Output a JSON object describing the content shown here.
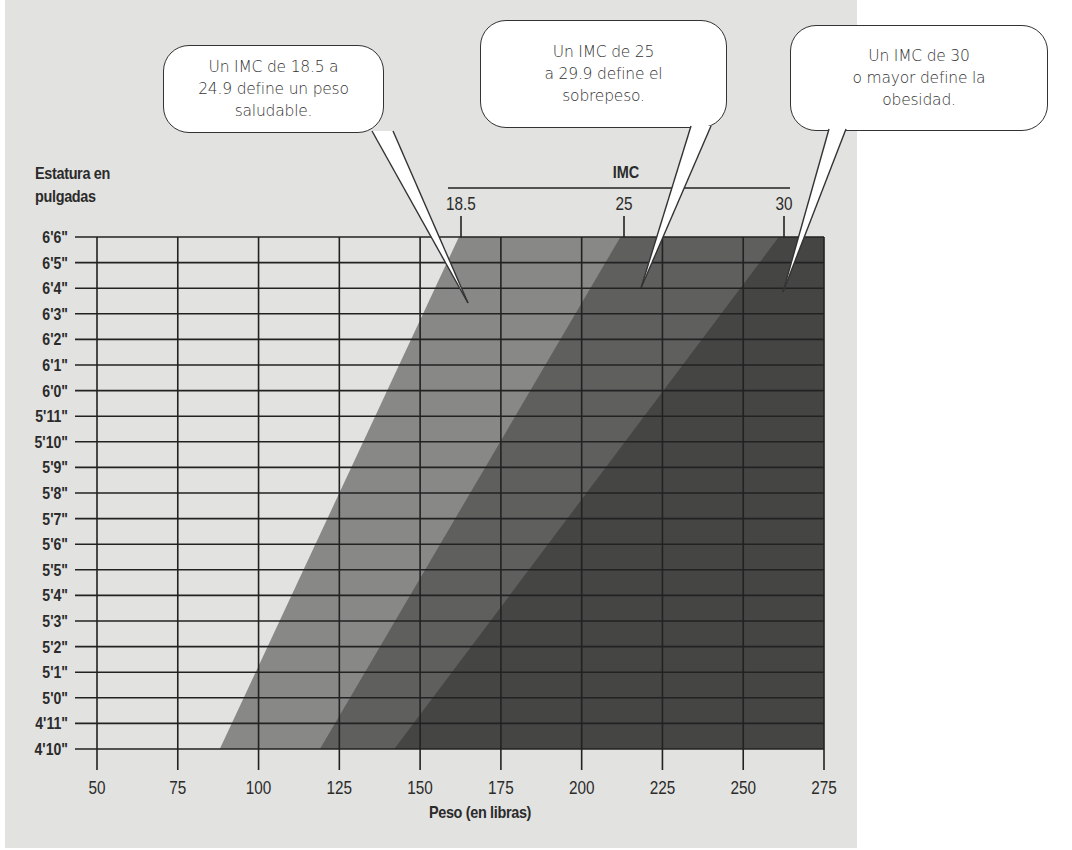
{
  "chart_data": {
    "type": "area",
    "title": "",
    "xlabel": "Peso (en libras)",
    "ylabel": "Estatura en pulgadas",
    "x_ticks": [
      50,
      75,
      100,
      125,
      150,
      175,
      200,
      225,
      250,
      275
    ],
    "xlim": [
      50,
      275
    ],
    "y_ticks": [
      "4'10\"",
      "4'11\"",
      "5'0\"",
      "5'1\"",
      "5'2\"",
      "5'3\"",
      "5'4\"",
      "5'5\"",
      "5'6\"",
      "5'7\"",
      "5'8\"",
      "5'9\"",
      "5'10\"",
      "5'11\"",
      "6'0\"",
      "6'1\"",
      "6'2\"",
      "6'3\"",
      "6'4\"",
      "6'5\"",
      "6'6\""
    ],
    "y_inches": [
      58,
      78
    ],
    "grid": true,
    "secondary_axis": {
      "title": "IMC",
      "ticks": [
        "18.5",
        "25",
        "30"
      ],
      "tick_weights_at_top": [
        162,
        219,
        268
      ]
    },
    "series": [
      {
        "name": "IMC 18.5 – 24.9 (peso saludable)",
        "bmi_min": 18.5,
        "boundary_weight_at_4_10": 88,
        "boundary_weight_at_6_6": 162,
        "color": "#888887"
      },
      {
        "name": "IMC 25 – 29.9 (sobrepeso)",
        "bmi_min": 25,
        "boundary_weight_at_4_10": 119,
        "boundary_weight_at_6_6": 212,
        "color": "#5f5f5e"
      },
      {
        "name": "IMC 30 o mayor (obesidad)",
        "bmi_min": 30,
        "boundary_weight_at_4_10": 142,
        "boundary_weight_at_6_6": 261,
        "color": "#454544"
      }
    ],
    "annotations": [
      "Un IMC de 18.5 a 24.9 define un peso saludable.",
      "Un IMC de 25 a 29.9 define el sobrepeso.",
      "Un IMC de 30 o mayor define la obesidad."
    ]
  },
  "labels": {
    "y_title": "Estatura en\npulgadas",
    "x_title": "Peso (en libras)",
    "imc_title": "IMC"
  },
  "callouts": [
    {
      "text": "Un IMC de 18.5 a\n24.9 define un peso\nsaludable."
    },
    {
      "text": "Un IMC de 25\na 29.9 define el\nsobrepeso."
    },
    {
      "text": "Un IMC de 30\no mayor define la\nobesidad."
    }
  ],
  "colors": {
    "background": "#e2e2e0",
    "grid": "#222222",
    "text": "#2b2b2b"
  }
}
